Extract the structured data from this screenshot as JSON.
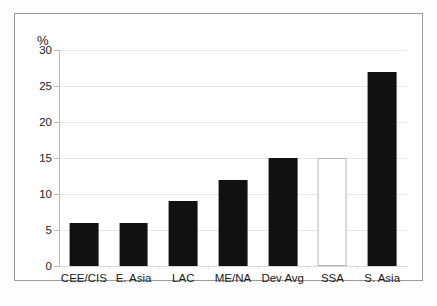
{
  "chart_data": {
    "type": "bar",
    "title": "",
    "xlabel": "",
    "ylabel": "%",
    "ylim": [
      0,
      30
    ],
    "yticks": [
      0,
      5,
      10,
      15,
      20,
      25,
      30
    ],
    "ytick_labels": [
      "0",
      "5",
      "10",
      "15",
      "20",
      "25",
      "30"
    ],
    "grid": true,
    "legend": "none",
    "categories": [
      "CEE/CIS",
      "E. Asia",
      "LAC",
      "ME/NA",
      "Dev Avg",
      "SSA",
      "S. Asia"
    ],
    "values": [
      6,
      6,
      9,
      12,
      15,
      15,
      27
    ],
    "bar_styles": [
      "filled",
      "filled",
      "filled",
      "filled",
      "filled",
      "hollow",
      "filled"
    ],
    "colors": {
      "bar_fill": "#111111",
      "bar_hollow_fill": "#ffffff",
      "bar_hollow_outline": "#b4b4b4",
      "gridline": "#e8e8e8",
      "axis": "#bcbcbc",
      "frame_border": "#9a9a9a",
      "text": "#1a1a1a",
      "background": "#ffffff"
    }
  }
}
